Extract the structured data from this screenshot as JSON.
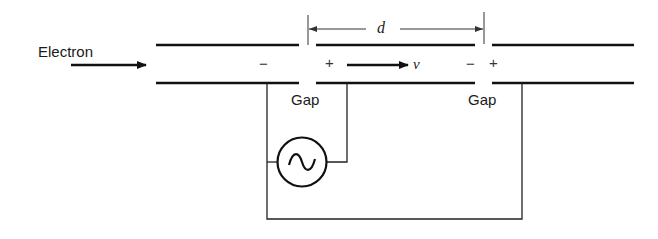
{
  "diagram": {
    "type": "two-gap klystron / drift-tube electron accelerator schematic",
    "labels": {
      "electron": "Electron",
      "gap_left": "Gap",
      "gap_right": "Gap",
      "distance": "d",
      "velocity": "v"
    },
    "signs": {
      "gap1_left": "−",
      "gap1_right": "+",
      "gap2_left": "−",
      "gap2_right": "+"
    },
    "components": {
      "drift_tube_segments": 3,
      "ac_source_symbol": "sine-wave-in-circle",
      "wiring": "AC source connected across gaps; left side to first segment, right side to second segment; return wire to third segment"
    },
    "colors": {
      "line": "#111111",
      "background": "#ffffff"
    }
  }
}
